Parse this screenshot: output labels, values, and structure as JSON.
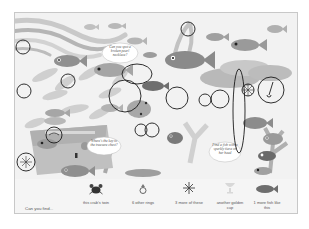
{
  "page": {
    "type": "search-and-find book page",
    "theme": "underwater ocean scene",
    "colors": {
      "background": "#f2f2f2",
      "fish_dark": "#6e6e6e",
      "fish_mid": "#9a9a9a",
      "fish_light": "#c4c4c4",
      "coral": "#bdbdbd",
      "circle_marks": "#1a1a1a"
    }
  },
  "speech_bubbles": [
    {
      "id": "necklace",
      "text": "Can you spot a broken pearl necklace?"
    },
    {
      "id": "key",
      "text": "Where's the key to the treasure chest?"
    },
    {
      "id": "tiara",
      "text": "Find a fish with a sparkly tiara on her head"
    }
  ],
  "find_strip": {
    "title": "Can you find...",
    "items": [
      {
        "icon": "crab-icon",
        "label": "this crab's twin"
      },
      {
        "icon": "ring-icon",
        "label": "6 other rings"
      },
      {
        "icon": "starfish-icon",
        "label": "3 more of these"
      },
      {
        "icon": "golden-cup-icon",
        "label": "another golden cup"
      },
      {
        "icon": "fish-icon",
        "label": "1 more fish like this"
      }
    ]
  },
  "circle_marks": [
    {
      "x": 22,
      "y": 46,
      "r": 7,
      "label": "ring"
    },
    {
      "x": 67,
      "y": 80,
      "r": 7,
      "label": "ring"
    },
    {
      "x": 23,
      "y": 90,
      "r": 7,
      "label": "ring"
    },
    {
      "x": 136,
      "y": 73,
      "rx": 15,
      "ry": 10,
      "label": "fish like this"
    },
    {
      "x": 124,
      "y": 95,
      "r": 16,
      "label": "fish like this"
    },
    {
      "x": 187,
      "y": 28,
      "r": 7,
      "label": "ring"
    },
    {
      "x": 175,
      "y": 97,
      "r": 11,
      "label": "golden cup"
    },
    {
      "x": 204,
      "y": 99,
      "r": 6,
      "label": "ring"
    },
    {
      "x": 219,
      "y": 98,
      "r": 9,
      "label": "crab twin"
    },
    {
      "x": 238,
      "y": 102,
      "rx": 6,
      "ry": 52,
      "label": "necklace"
    },
    {
      "x": 249,
      "y": 89,
      "r": 7,
      "label": "starfish"
    },
    {
      "x": 270,
      "y": 88,
      "r": 13,
      "label": "key"
    },
    {
      "x": 53,
      "y": 134,
      "r": 8,
      "label": "necklace piece"
    },
    {
      "x": 25,
      "y": 161,
      "r": 9,
      "label": "starfish"
    },
    {
      "x": 140,
      "y": 141,
      "r": 5,
      "label": "ring"
    },
    {
      "x": 128,
      "y": 127,
      "r": 7,
      "label": "starfish"
    }
  ]
}
